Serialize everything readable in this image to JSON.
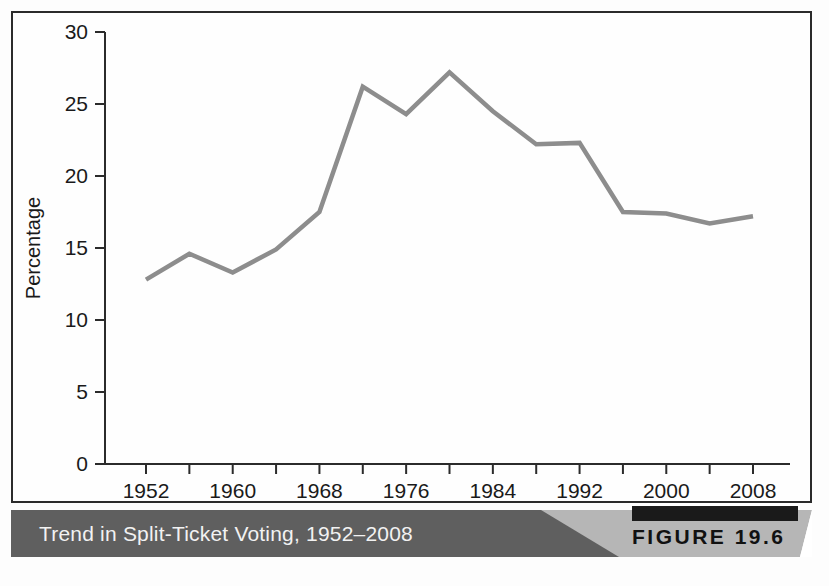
{
  "figure": {
    "caption": "Trend in Split-Ticket Voting, 1952–2008",
    "tag_prefix": "FIGURE",
    "tag_number": "19.6",
    "tag_label": "FIGURE 19.6",
    "caption_bar_color": "#5f5f5f",
    "caption_bar_accent_color": "#b6b6b6",
    "caption_text_color": "#f2f2f2",
    "tag_bar_color": "#1a1a1a"
  },
  "chart_data": {
    "type": "line",
    "title": "Trend in Split-Ticket Voting, 1952–2008",
    "xlabel": "",
    "ylabel": "Percentage",
    "x": [
      1952,
      1956,
      1960,
      1964,
      1968,
      1972,
      1976,
      1980,
      1984,
      1988,
      1992,
      1996,
      2000,
      2004,
      2008
    ],
    "values": [
      12.8,
      14.6,
      13.3,
      14.9,
      17.5,
      26.2,
      24.3,
      27.2,
      24.5,
      22.2,
      22.3,
      17.5,
      17.4,
      16.7,
      17.2
    ],
    "series": [
      {
        "name": "Split-ticket voting",
        "color": "#8d8d8d",
        "values": [
          12.8,
          14.6,
          13.3,
          14.9,
          17.5,
          26.2,
          24.3,
          27.2,
          24.5,
          22.2,
          22.3,
          17.5,
          17.4,
          16.7,
          17.2
        ]
      }
    ],
    "xlim": [
      1952,
      2008
    ],
    "ylim": [
      0,
      30
    ],
    "y_ticks": [
      0,
      5,
      10,
      15,
      20,
      25,
      30
    ],
    "y_tick_labels": [
      "0",
      "5",
      "10",
      "15",
      "20",
      "25",
      "30"
    ],
    "x_ticks": [
      1952,
      1956,
      1960,
      1964,
      1968,
      1972,
      1976,
      1980,
      1984,
      1988,
      1992,
      1996,
      2000,
      2004,
      2008
    ],
    "x_tick_labels_shown": [
      "1952",
      "1960",
      "1968",
      "1976",
      "1984",
      "1992",
      "2000",
      "2008"
    ],
    "x_labeled_ticks": [
      1952,
      1960,
      1968,
      1976,
      1984,
      1992,
      2000,
      2008
    ],
    "grid": false,
    "legend": "none",
    "line_color": "#8d8d8d",
    "axis_color": "#2b2b2b"
  }
}
